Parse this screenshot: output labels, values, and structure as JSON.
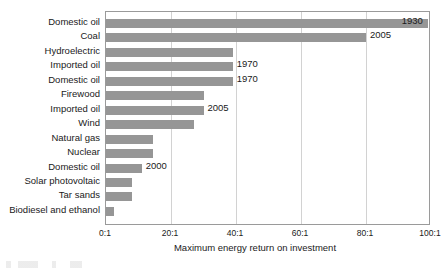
{
  "chart_data": {
    "type": "bar",
    "orientation": "horizontal",
    "title": "",
    "xlabel": "Maximum energy return on investment",
    "ylabel": "",
    "xlim": [
      0,
      100
    ],
    "xticks": [
      "0:1",
      "20:1",
      "40:1",
      "60:1",
      "80:1",
      "100:1"
    ],
    "xtick_values": [
      0,
      20,
      40,
      60,
      80,
      100
    ],
    "grid": true,
    "grid_axis": "x",
    "legend": "none",
    "bar_color": "#969696",
    "categories": [
      "Domestic oil",
      "Coal",
      "Hydroelectric",
      "Imported oil",
      "Domestic oil",
      "Firewood",
      "Imported oil",
      "Wind",
      "Natural gas",
      "Nuclear",
      "Domestic oil",
      "Solar photovoltaic",
      "Tar sands",
      "Biodiesel and ethanol"
    ],
    "values": [
      99,
      80,
      39,
      39,
      39,
      30,
      30,
      27,
      14.5,
      14.5,
      11,
      8,
      8,
      2.5
    ],
    "annotations": [
      {
        "index": 0,
        "label": "1930",
        "placement": "inside-right"
      },
      {
        "index": 1,
        "label": "2005",
        "placement": "outside-right"
      },
      {
        "index": 2,
        "label": "",
        "placement": "none"
      },
      {
        "index": 3,
        "label": "1970",
        "placement": "outside-right"
      },
      {
        "index": 4,
        "label": "1970",
        "placement": "outside-right"
      },
      {
        "index": 5,
        "label": "",
        "placement": "none"
      },
      {
        "index": 6,
        "label": "2005",
        "placement": "outside-right"
      },
      {
        "index": 7,
        "label": "",
        "placement": "none"
      },
      {
        "index": 8,
        "label": "",
        "placement": "none"
      },
      {
        "index": 9,
        "label": "",
        "placement": "none"
      },
      {
        "index": 10,
        "label": "2000",
        "placement": "outside-right"
      },
      {
        "index": 11,
        "label": "",
        "placement": "none"
      },
      {
        "index": 12,
        "label": "",
        "placement": "none"
      },
      {
        "index": 13,
        "label": "",
        "placement": "none"
      }
    ]
  }
}
